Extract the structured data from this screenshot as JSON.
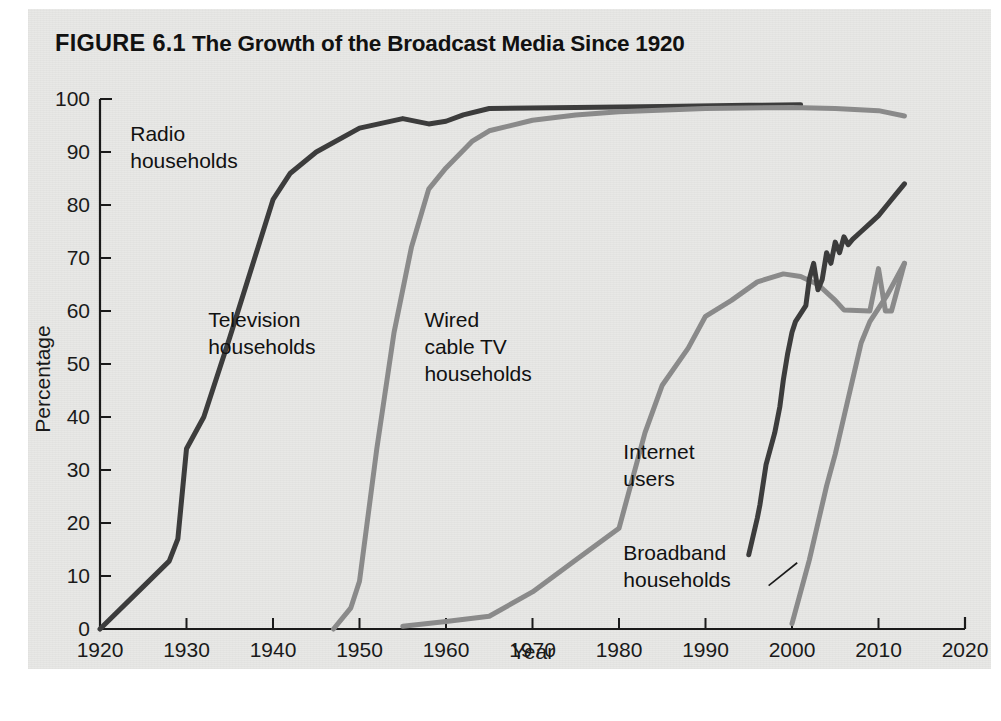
{
  "figure": {
    "number_label": "FIGURE 6.1",
    "title": "The Growth of the Broadcast Media Since 1920",
    "background_color": "#e8e8e6"
  },
  "chart_data": {
    "type": "line",
    "title": "The Growth of the Broadcast Media Since 1920",
    "xlabel": "Year",
    "ylabel": "Percentage",
    "xlim": [
      1920,
      2020
    ],
    "ylim": [
      0,
      100
    ],
    "xticks": [
      1920,
      1930,
      1940,
      1950,
      1960,
      1970,
      1980,
      1990,
      2000,
      2010,
      2020
    ],
    "yticks": [
      0,
      10,
      20,
      30,
      40,
      50,
      60,
      70,
      80,
      90,
      100
    ],
    "grid": false,
    "legend_position": "inline-annotations",
    "series": [
      {
        "name": "Radio households",
        "color": "#3c3c3c",
        "label_lines": [
          "Radio",
          "households"
        ],
        "points": [
          [
            1920,
            0
          ],
          [
            1925,
            8
          ],
          [
            1928,
            12.8
          ],
          [
            1929,
            17
          ],
          [
            1930,
            34
          ],
          [
            1932,
            40
          ],
          [
            1935,
            55
          ],
          [
            1940,
            81
          ],
          [
            1942,
            86
          ],
          [
            1945,
            90
          ],
          [
            1950,
            94.5
          ],
          [
            1955,
            96.3
          ],
          [
            1958,
            95.3
          ],
          [
            1960,
            95.8
          ],
          [
            1962,
            97
          ],
          [
            1965,
            98.2
          ],
          [
            1975,
            98.4
          ],
          [
            1985,
            98.6
          ],
          [
            1995,
            98.8
          ],
          [
            2001,
            98.9
          ]
        ]
      },
      {
        "name": "Television households",
        "color": "#8a8a8a",
        "label_lines": [
          "Television",
          "households"
        ],
        "points": [
          [
            1947,
            0
          ],
          [
            1949,
            4
          ],
          [
            1950,
            9
          ],
          [
            1952,
            34
          ],
          [
            1954,
            56
          ],
          [
            1956,
            72
          ],
          [
            1958,
            83
          ],
          [
            1960,
            87
          ],
          [
            1963,
            92
          ],
          [
            1965,
            94
          ],
          [
            1970,
            96
          ],
          [
            1975,
            97
          ],
          [
            1980,
            97.6
          ],
          [
            1990,
            98.2
          ],
          [
            2000,
            98.4
          ],
          [
            2005,
            98.2
          ],
          [
            2010,
            97.8
          ],
          [
            2013,
            96.8
          ]
        ]
      },
      {
        "name": "Wired cable TV households",
        "color": "#8a8a8a",
        "label_lines": [
          "Wired",
          "cable TV",
          "households"
        ],
        "points": [
          [
            1955,
            0.5
          ],
          [
            1960,
            1.4
          ],
          [
            1965,
            2.4
          ],
          [
            1970,
            7
          ],
          [
            1975,
            13
          ],
          [
            1980,
            19
          ],
          [
            1983,
            37
          ],
          [
            1985,
            46
          ],
          [
            1988,
            53
          ],
          [
            1990,
            59
          ],
          [
            1993,
            62
          ],
          [
            1996,
            65.5
          ],
          [
            1999,
            67
          ],
          [
            2001,
            66.5
          ],
          [
            2003,
            65
          ],
          [
            2005,
            62
          ],
          [
            2006,
            60.2
          ],
          [
            2009,
            60
          ],
          [
            2010,
            68
          ],
          [
            2010.8,
            60
          ],
          [
            2011.5,
            60
          ],
          [
            2013,
            69
          ]
        ]
      },
      {
        "name": "Internet users",
        "color": "#3c3c3c",
        "label_lines": [
          "Internet",
          "users"
        ],
        "points": [
          [
            1995,
            14
          ],
          [
            1996,
            21
          ],
          [
            1996.3,
            23.5
          ],
          [
            1997,
            31
          ],
          [
            1998,
            37
          ],
          [
            1998.6,
            42
          ],
          [
            1999,
            47
          ],
          [
            1999.5,
            52
          ],
          [
            2000,
            56
          ],
          [
            2000.4,
            58
          ],
          [
            2001,
            59.5
          ],
          [
            2001.6,
            61
          ],
          [
            2002,
            66
          ],
          [
            2002.5,
            69
          ],
          [
            2003,
            64
          ],
          [
            2003.5,
            66
          ],
          [
            2004,
            71
          ],
          [
            2004.5,
            69
          ],
          [
            2005,
            73
          ],
          [
            2005.5,
            71
          ],
          [
            2006,
            74
          ],
          [
            2006.5,
            72.5
          ],
          [
            2007,
            73.5
          ],
          [
            2008,
            75
          ],
          [
            2009,
            76.5
          ],
          [
            2010,
            78
          ],
          [
            2011,
            80
          ],
          [
            2012,
            82
          ],
          [
            2013,
            84
          ]
        ]
      },
      {
        "name": "Broadband households",
        "color": "#8a8a8a",
        "label_lines": [
          "Broadband",
          "households"
        ],
        "points": [
          [
            2000,
            1
          ],
          [
            2001,
            7
          ],
          [
            2002,
            13
          ],
          [
            2003,
            20
          ],
          [
            2004,
            27
          ],
          [
            2005,
            33
          ],
          [
            2006,
            40
          ],
          [
            2007,
            47
          ],
          [
            2008,
            54
          ],
          [
            2009,
            58
          ],
          [
            2010,
            60.5
          ],
          [
            2011,
            63
          ],
          [
            2012,
            66
          ],
          [
            2013,
            69
          ]
        ]
      }
    ],
    "annotations": [
      {
        "text": "Radio households",
        "x": 1923.5,
        "y": 92
      },
      {
        "text": "Television households",
        "x": 1932.5,
        "y": 57
      },
      {
        "text": "Wired cable TV households",
        "x": 1957.5,
        "y": 57
      },
      {
        "text": "Internet users",
        "x": 1980.5,
        "y": 32
      },
      {
        "text": "Broadband households",
        "x": 1980.5,
        "y": 13
      }
    ]
  }
}
